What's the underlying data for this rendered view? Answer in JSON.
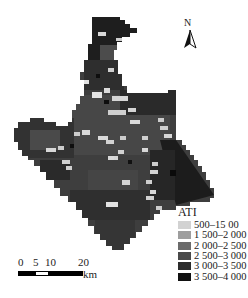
{
  "map": {
    "title": "ATI",
    "north_label": "N",
    "legend": {
      "title": "ATI",
      "items": [
        {
          "label": "500–15 00",
          "color": "#d2d2d2"
        },
        {
          "label": "1 500–2 000",
          "color": "#9e9e9e"
        },
        {
          "label": "2 000–2 500",
          "color": "#6b6b6b"
        },
        {
          "label": "2 500–3 000",
          "color": "#4a4a4a"
        },
        {
          "label": "3 000–3 500",
          "color": "#2c2c2c"
        },
        {
          "label": "3 500–4 000",
          "color": "#111111"
        }
      ]
    },
    "scale_bar": {
      "ticks": [
        "0",
        "5",
        "10",
        "20"
      ],
      "unit": "km"
    }
  }
}
